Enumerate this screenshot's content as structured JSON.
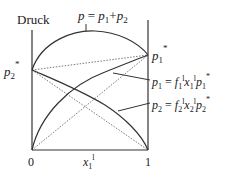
{
  "diagram": {
    "y_axis_label": "Druck",
    "total_curve_label": {
      "p": "p",
      "eq": " = ",
      "p1": "p",
      "sub1": "1",
      "plus": "+",
      "p2": "p",
      "sub2": "2"
    },
    "left_value_label": {
      "p": "p",
      "sub": "2",
      "sup": "*"
    },
    "right_value_label": {
      "p": "p",
      "sub": "1",
      "sup": "*"
    },
    "curve1_label": {
      "lhs": "p",
      "lhs_sub": "1",
      "eq": " = ",
      "f": "f",
      "f_sub": "1",
      "f_sup": "l",
      "x": "x",
      "x_sub": "1",
      "x_sup": "l",
      "ps": "p",
      "ps_sub": "1",
      "ps_sup": "*"
    },
    "curve2_label": {
      "lhs": "p",
      "lhs_sub": "2",
      "eq": " = ",
      "f": "f",
      "f_sub": "2",
      "f_sup": "l",
      "x": "x",
      "x_sub": "2",
      "x_sup": "l",
      "ps": "p",
      "ps_sub": "2",
      "ps_sup": "*"
    },
    "x_axis": {
      "tick_left": "0",
      "tick_right": "1",
      "label": "x",
      "label_sub": "1",
      "label_sup": "l"
    },
    "colors": {
      "line": "#333333",
      "text": "#1a1a1a",
      "background": "#ffffff"
    }
  }
}
